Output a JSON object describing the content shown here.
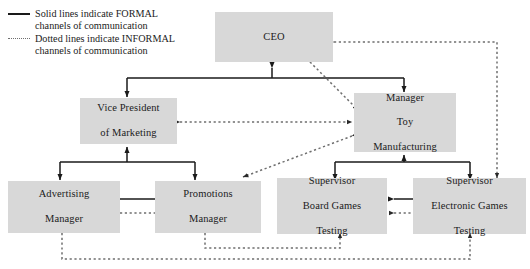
{
  "diagram": {
    "type": "organization-chart",
    "colors": {
      "node_fill": "#d8d8d8",
      "formal_line": "#1a1a1a",
      "informal_line": "#6f6f6f",
      "background": "#ffffff"
    },
    "legend": {
      "items": [
        {
          "style": "solid",
          "swatch": "solid-line-swatch",
          "line1": "Solid lines indicate FORMAL",
          "line2": "channels of communication"
        },
        {
          "style": "dotted",
          "swatch": "dotted-line-swatch",
          "line1": "Dotted lines indicate INFORMAL",
          "line2": "channels of communication"
        }
      ]
    },
    "nodes": [
      {
        "id": "ceo",
        "lines": [
          "CEO"
        ]
      },
      {
        "id": "vp_marketing",
        "lines": [
          "Vice President",
          "of Marketing"
        ]
      },
      {
        "id": "mgr_toy",
        "lines": [
          "Manager",
          "Toy",
          "Manufacturing"
        ]
      },
      {
        "id": "advertising",
        "lines": [
          "Advertising",
          "Manager"
        ]
      },
      {
        "id": "promotions",
        "lines": [
          "Promotions",
          "Manager"
        ]
      },
      {
        "id": "sup_board",
        "lines": [
          "Supervisor",
          "Board Games",
          "Testing"
        ]
      },
      {
        "id": "sup_electronic",
        "lines": [
          "Supervisor",
          "Electronic Games",
          "Testing"
        ]
      }
    ],
    "edges": [
      {
        "from": "ceo",
        "to": "vp_marketing",
        "style": "solid",
        "direction": "both"
      },
      {
        "from": "ceo",
        "to": "mgr_toy",
        "style": "solid",
        "direction": "both"
      },
      {
        "from": "ceo",
        "to": "mgr_toy",
        "style": "dotted",
        "direction": "both"
      },
      {
        "from": "vp_marketing",
        "to": "mgr_toy",
        "style": "dotted",
        "direction": "both"
      },
      {
        "from": "vp_marketing",
        "to": "advertising",
        "style": "solid",
        "direction": "both"
      },
      {
        "from": "vp_marketing",
        "to": "promotions",
        "style": "solid",
        "direction": "both"
      },
      {
        "from": "mgr_toy",
        "to": "sup_board",
        "style": "solid",
        "direction": "both"
      },
      {
        "from": "mgr_toy",
        "to": "sup_electronic",
        "style": "solid",
        "direction": "both"
      },
      {
        "from": "mgr_toy",
        "to": "promotions",
        "style": "dotted",
        "direction": "both"
      },
      {
        "from": "advertising",
        "to": "promotions",
        "style": "solid",
        "direction": "both"
      },
      {
        "from": "advertising",
        "to": "promotions",
        "style": "dotted",
        "direction": "both"
      },
      {
        "from": "sup_board",
        "to": "sup_electronic",
        "style": "solid",
        "direction": "both"
      },
      {
        "from": "sup_board",
        "to": "sup_electronic",
        "style": "dotted",
        "direction": "both"
      },
      {
        "from": "promotions",
        "to": "sup_board",
        "style": "dotted",
        "direction": "both"
      },
      {
        "from": "advertising",
        "to": "sup_electronic",
        "style": "dotted",
        "direction": "both"
      },
      {
        "from": "ceo",
        "to": "sup_electronic",
        "style": "dotted",
        "direction": "both"
      }
    ]
  }
}
